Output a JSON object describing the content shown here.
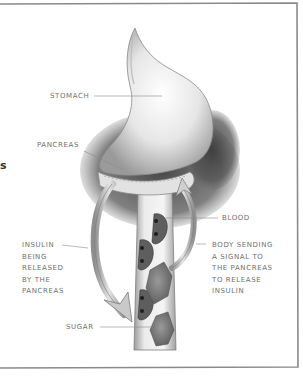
{
  "figure": {
    "type": "medical illustration",
    "labels": {
      "stomach": "STOMACH",
      "pancreas": "PANCREAS",
      "blood": "BLOOD",
      "insulin_released": "INSULIN\nBEING\nRELEASED\nBY THE\nPANCREAS",
      "body_signal": "BODY SENDING\nA SIGNAL TO\nTHE PANCREAS\nTO RELEASE\nINSULIN",
      "sugar": "SUGAR"
    },
    "edge_fragment": "s",
    "colors": {
      "ink": "#6f6f6f",
      "frame": "#8a8a8a",
      "shade": "#4a4a4a",
      "sugar": "#7a7a7a",
      "background": "#ffffff"
    }
  }
}
